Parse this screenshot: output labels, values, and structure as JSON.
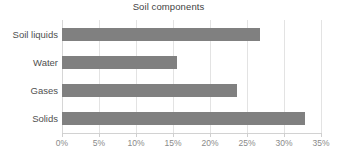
{
  "chart_data": {
    "type": "bar",
    "orientation": "horizontal",
    "title": "Soil components",
    "xlabel": "",
    "ylabel": "",
    "categories": [
      "Soil liquids",
      "Water",
      "Gases",
      "Solids"
    ],
    "values": [
      26.8,
      15.5,
      23.7,
      32.8
    ],
    "value_suffix": "%",
    "xlim": [
      0,
      35
    ],
    "xticks": [
      0,
      5,
      10,
      15,
      20,
      25,
      30,
      35
    ],
    "xtick_labels": [
      "0%",
      "5%",
      "10%",
      "15%",
      "20%",
      "25%",
      "30%",
      "35%"
    ],
    "grid": "vertical",
    "legend": "none",
    "bar_color": "#808080",
    "gridline_color": "#e3e3e3",
    "axis_color": "#d2d2d2",
    "title_color": "#3f3f3f",
    "tick_label_color": "#8a8a8a",
    "category_label_color": "#4f4f4f",
    "background_color": "#ffffff"
  }
}
